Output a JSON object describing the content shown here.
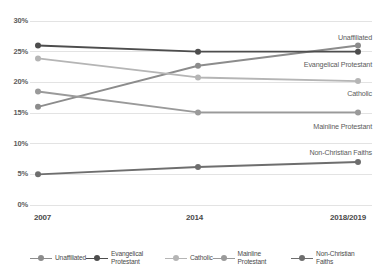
{
  "chart_data": {
    "type": "line",
    "title": "",
    "subtitle": "",
    "xlabel": "",
    "ylabel": "",
    "x": [
      "2007",
      "2014",
      "2018/2019"
    ],
    "categories": [
      "2007",
      "2014",
      "2018/2019"
    ],
    "ylim": [
      0,
      30
    ],
    "yticks": [
      0,
      5,
      10,
      15,
      20,
      25,
      30
    ],
    "ytick_labels": [
      "0%",
      "5%",
      "10%",
      "15%",
      "20%",
      "25%",
      "30%"
    ],
    "grid": true,
    "grid_axis": "y",
    "legend_position": "bottom",
    "value_suffix": "%",
    "series": [
      {
        "name": "Unaffiliated",
        "values": [
          16.0,
          22.7,
          26.0
        ],
        "color": "#8c8c8c",
        "end_label": "Unaffiliated"
      },
      {
        "name": "Evangelical Protestant",
        "values": [
          26.0,
          25.0,
          25.0
        ],
        "color": "#4d4d4d",
        "end_label": "Evangelical Protestant"
      },
      {
        "name": "Catholic",
        "values": [
          23.9,
          20.8,
          20.2
        ],
        "color": "#b5b5b5",
        "end_label": "Catholic"
      },
      {
        "name": "Mainline Protestant",
        "values": [
          18.5,
          15.1,
          15.1
        ],
        "color": "#9a9a9a",
        "end_label": "Mainline Protestant"
      },
      {
        "name": "Non-Christian Faiths",
        "values": [
          5.0,
          6.2,
          7.0
        ],
        "color": "#6e6e6e",
        "end_label": "Non-Christian Faiths"
      }
    ]
  },
  "legend": {
    "items": [
      {
        "label": "Unaffiliated",
        "color": "#8c8c8c"
      },
      {
        "label": "Evangelical Protestant",
        "color": "#4d4d4d"
      },
      {
        "label": "Catholic",
        "color": "#b5b5b5"
      },
      {
        "label": "Mainline Protestant",
        "color": "#9a9a9a"
      },
      {
        "label": "Non-Christian Faiths",
        "color": "#6e6e6e"
      }
    ]
  },
  "colors": {
    "background": "#ffffff",
    "gridline": "#e3e3e3",
    "axis_text": "#4a4a4a",
    "label_text": "#5c5c5c"
  }
}
